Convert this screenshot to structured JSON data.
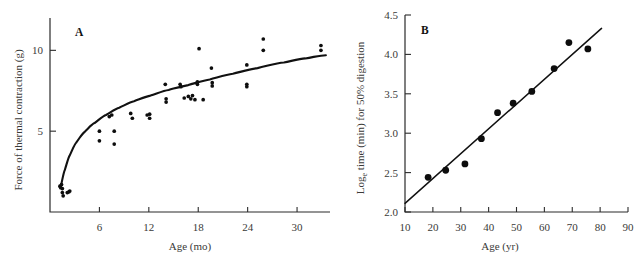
{
  "figure": {
    "background_color": "#ffffff",
    "ink_color": "#111111",
    "label_color": "#3a3a38"
  },
  "panels": [
    {
      "letter": "A",
      "xlabel": "Age (mo)",
      "ylabel": "Force of thermal contraction (g)"
    },
    {
      "letter": "B",
      "xlabel": "Age (yr)",
      "ylabel": "Logₑ time (min) for 50% digestion"
    }
  ],
  "chart_data": [
    {
      "type": "scatter",
      "title": "A",
      "xlabel": "Age (mo)",
      "ylabel": "Force of thermal contraction (g)",
      "xlim": [
        0,
        34
      ],
      "ylim": [
        0,
        12
      ],
      "xticks": [
        6,
        12,
        18,
        24,
        30
      ],
      "yticks": [
        5,
        10
      ],
      "grid": false,
      "legend": "none",
      "points": [
        [
          1.2,
          1.6
        ],
        [
          1.3,
          1.5
        ],
        [
          1.4,
          1.7
        ],
        [
          1.5,
          1.45
        ],
        [
          1.5,
          1.2
        ],
        [
          1.6,
          1.0
        ],
        [
          2.1,
          1.2
        ],
        [
          2.3,
          1.25
        ],
        [
          2.4,
          1.3
        ],
        [
          6.0,
          5.0
        ],
        [
          6.0,
          4.4
        ],
        [
          7.2,
          5.9
        ],
        [
          7.5,
          6.0
        ],
        [
          7.8,
          5.0
        ],
        [
          7.8,
          4.2
        ],
        [
          9.8,
          6.1
        ],
        [
          10.0,
          5.8
        ],
        [
          11.8,
          6.0
        ],
        [
          12.1,
          6.05
        ],
        [
          12.1,
          5.8
        ],
        [
          14.0,
          7.9
        ],
        [
          14.1,
          7.0
        ],
        [
          14.1,
          6.8
        ],
        [
          15.8,
          7.9
        ],
        [
          15.9,
          7.75
        ],
        [
          16.3,
          7.05
        ],
        [
          16.8,
          7.15
        ],
        [
          17.1,
          7.0
        ],
        [
          17.3,
          7.2
        ],
        [
          17.6,
          6.95
        ],
        [
          17.9,
          8.05
        ],
        [
          17.9,
          7.9
        ],
        [
          18.1,
          10.1
        ],
        [
          18.6,
          6.95
        ],
        [
          19.6,
          8.9
        ],
        [
          19.7,
          8.0
        ],
        [
          19.7,
          7.8
        ],
        [
          23.9,
          9.1
        ],
        [
          23.9,
          7.9
        ],
        [
          23.9,
          7.75
        ],
        [
          25.9,
          10.7
        ],
        [
          25.9,
          10.0
        ],
        [
          32.9,
          10.3
        ],
        [
          32.9,
          10.0
        ]
      ],
      "fit": {
        "kind": "saturating-curve",
        "description": "monotonic increasing curve flattening with age",
        "samples": [
          [
            1.3,
            1.55
          ],
          [
            1.8,
            2.6
          ],
          [
            2.4,
            3.5
          ],
          [
            3.2,
            4.3
          ],
          [
            4.2,
            4.95
          ],
          [
            5.4,
            5.5
          ],
          [
            6.8,
            6.0
          ],
          [
            8.4,
            6.45
          ],
          [
            10.2,
            6.85
          ],
          [
            12.2,
            7.2
          ],
          [
            14.4,
            7.55
          ],
          [
            16.8,
            7.85
          ],
          [
            19.4,
            8.2
          ],
          [
            22.2,
            8.55
          ],
          [
            25.2,
            8.9
          ],
          [
            28.4,
            9.25
          ],
          [
            31.0,
            9.5
          ],
          [
            33.5,
            9.7
          ]
        ]
      }
    },
    {
      "type": "scatter",
      "title": "B",
      "xlabel": "Age (yr)",
      "ylabel": "Logₑ time (min) for 50% digestion",
      "xlim": [
        10,
        90
      ],
      "ylim": [
        2.0,
        4.5
      ],
      "xticks": [
        10,
        20,
        30,
        40,
        50,
        60,
        70,
        80,
        90
      ],
      "yticks": [
        2.0,
        2.5,
        3.0,
        3.5,
        4.0,
        4.5
      ],
      "ytick_labels": [
        "2.0",
        "2.5",
        "3.0",
        "3.5",
        "4.0",
        "4.5"
      ],
      "grid": false,
      "legend": "none",
      "points": [
        [
          18.3,
          2.44
        ],
        [
          24.6,
          2.53
        ],
        [
          31.5,
          2.61
        ],
        [
          37.4,
          2.93
        ],
        [
          43.2,
          3.26
        ],
        [
          48.8,
          3.38
        ],
        [
          55.5,
          3.53
        ],
        [
          63.5,
          3.82
        ],
        [
          68.8,
          4.15
        ],
        [
          75.6,
          4.07
        ]
      ],
      "fit": {
        "kind": "linear",
        "x_start": 10.0,
        "y_start": 2.11,
        "x_end": 80.5,
        "y_end": 4.33
      }
    }
  ]
}
